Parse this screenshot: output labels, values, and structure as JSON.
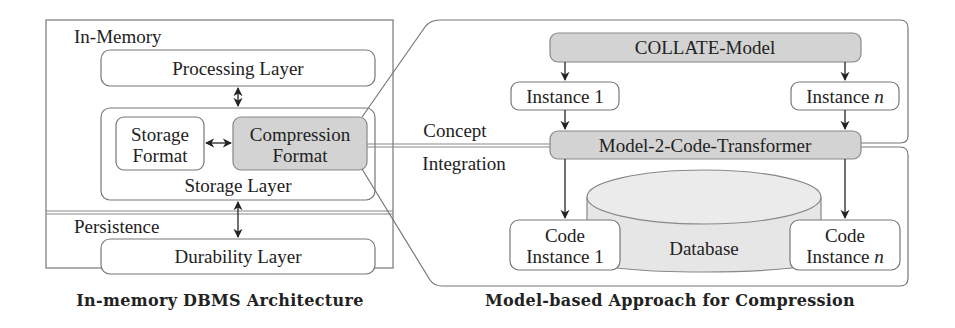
{
  "left_panel": {
    "caption": "In-memory DBMS Architecture",
    "in_memory_label": "In-Memory",
    "processing_layer": "Processing Layer",
    "storage_layer": "Storage Layer",
    "storage_format": [
      "Storage",
      "Format"
    ],
    "compression_format": [
      "Compression",
      "Format"
    ],
    "persistence_label": "Persistence",
    "durability_layer": "Durability Layer"
  },
  "connector": {
    "label_top": "Concept",
    "label_bottom": "Integration"
  },
  "right_panel": {
    "caption": "Model-based Approach for Compression",
    "model": "COLLATE-Model",
    "instance_1": "Instance 1",
    "instance_n_prefix": "Instance ",
    "instance_n_var": "n",
    "transformer": "Model-2-Code-Transformer",
    "database": "Database",
    "code_instance_1": [
      "Code",
      "Instance 1"
    ],
    "code_instance_n": [
      "Code",
      "Instance "
    ],
    "code_instance_n_var": "n"
  },
  "colors": {
    "highlight_fill": "#d3d3d3",
    "border": "#777777",
    "text": "#222222"
  }
}
